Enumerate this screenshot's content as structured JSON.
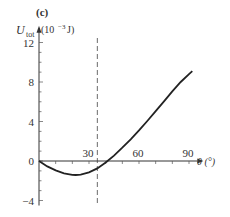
{
  "panel_label": "(c)",
  "chart_data": {
    "type": "line",
    "title": "",
    "panel": "(c)",
    "ylabel": "U_tot (10^-3 J)",
    "ylabel_main": "U",
    "ylabel_sub": "tot",
    "ylabel_unit": "(10",
    "ylabel_exp": "−3",
    "ylabel_unit_end": " J)",
    "xlabel": "θ (°)",
    "xlabel_text": "θ (°)",
    "xlim": [
      0,
      95
    ],
    "ylim": [
      -4,
      13
    ],
    "xticks": [
      30,
      60,
      90
    ],
    "xtick_labels": [
      "30",
      "60",
      "90"
    ],
    "yticks": [
      -4,
      0,
      4,
      8,
      12
    ],
    "ytick_labels": [
      "−4",
      "0",
      "4",
      "8",
      "12"
    ],
    "grid": false,
    "annotations": [
      {
        "type": "vertical-dashed-line",
        "x": 35
      }
    ],
    "series": [
      {
        "name": "U_tot",
        "x": [
          0,
          5,
          10,
          15,
          20,
          22,
          25,
          30,
          35,
          40,
          45,
          50,
          55,
          60,
          65,
          70,
          75,
          80,
          85,
          90,
          92
        ],
        "values": [
          0,
          -0.55,
          -0.95,
          -1.25,
          -1.4,
          -1.42,
          -1.38,
          -1.15,
          -0.75,
          -0.15,
          0.55,
          1.35,
          2.2,
          3.1,
          4.05,
          5.05,
          6.05,
          7.05,
          8.0,
          8.8,
          9.1
        ]
      }
    ]
  }
}
